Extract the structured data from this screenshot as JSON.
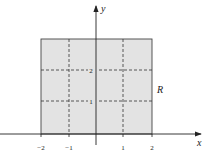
{
  "diagram": {
    "region_label": "R",
    "x_axis_label": "x",
    "y_axis_label": "y",
    "x_ticks": [
      "−2",
      "−1",
      "1",
      "2"
    ],
    "y_ticks": [
      "1",
      "2"
    ],
    "region": {
      "x_range": [
        -2,
        2
      ],
      "y_range": [
        0,
        3
      ],
      "fill": "#e3e3e3"
    },
    "grid_lines": {
      "x": [
        -1,
        1
      ],
      "y": [
        1,
        2
      ],
      "style": "dashed"
    }
  }
}
